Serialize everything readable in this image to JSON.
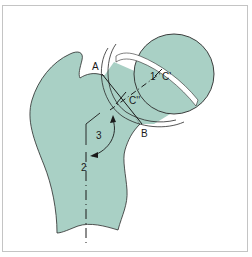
{
  "diagram": {
    "type": "anatomical-diagram",
    "colors": {
      "bone_fill": "#a9d0c5",
      "outline": "#2a2a2a",
      "background": "#ffffff",
      "frame_border": "#c4c4c4"
    },
    "labels": {
      "point_a": "A",
      "point_b": "B",
      "point_c_prime": "C'",
      "point_c_double_prime": "C''",
      "axis_1": "1",
      "axis_2": "2",
      "angle_3": "3"
    }
  }
}
